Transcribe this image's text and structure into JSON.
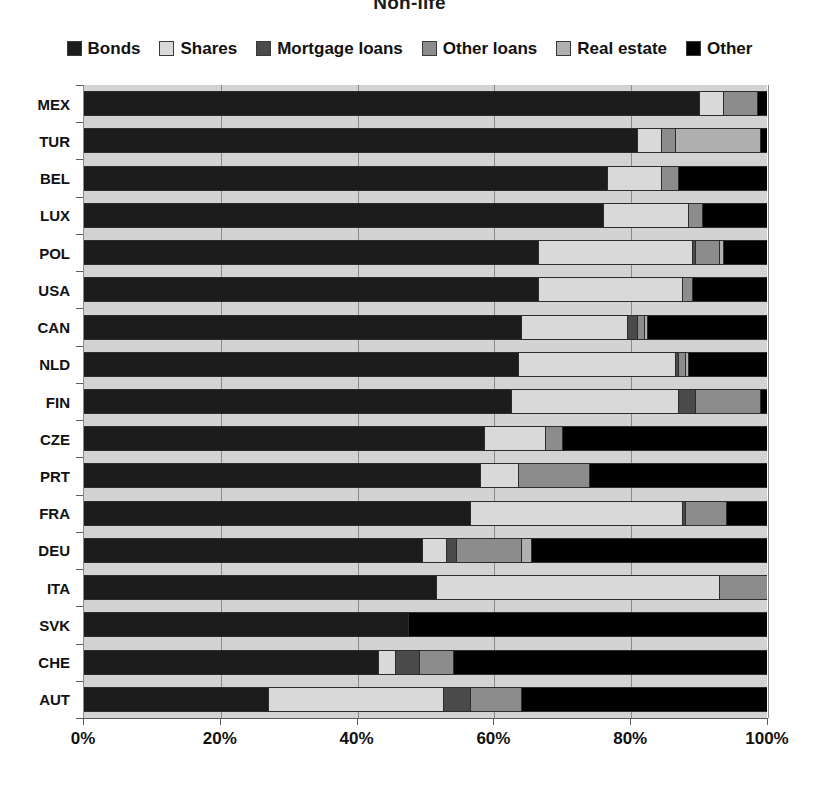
{
  "chart_data": {
    "type": "bar",
    "orientation": "horizontal",
    "stacked": true,
    "normalized": true,
    "title": "Non-life",
    "xlabel": "",
    "ylabel": "",
    "xlim": [
      0,
      100
    ],
    "xticks": [
      "0%",
      "20%",
      "40%",
      "60%",
      "80%",
      "100%"
    ],
    "xtick_values": [
      0,
      20,
      40,
      60,
      80,
      100
    ],
    "grid": true,
    "legend_position": "top",
    "categories": [
      "MEX",
      "TUR",
      "BEL",
      "LUX",
      "POL",
      "USA",
      "CAN",
      "NLD",
      "FIN",
      "CZE",
      "PRT",
      "FRA",
      "DEU",
      "ITA",
      "SVK",
      "CHE",
      "AUT"
    ],
    "series": [
      {
        "name": "Bonds",
        "color": "#1c1c1c",
        "values": [
          90.0,
          81.0,
          76.5,
          76.0,
          66.5,
          66.5,
          64.0,
          63.5,
          62.5,
          58.5,
          58.0,
          56.5,
          49.5,
          51.5,
          47.5,
          43.0,
          27.0
        ]
      },
      {
        "name": "Shares",
        "color": "#d9d9d9",
        "values": [
          3.5,
          3.5,
          8.0,
          12.5,
          22.5,
          21.0,
          15.5,
          23.0,
          24.5,
          9.0,
          5.5,
          31.0,
          3.5,
          41.5,
          0.0,
          2.5,
          25.5
        ]
      },
      {
        "name": "Mortgage loans",
        "color": "#4a4a4a",
        "values": [
          0.0,
          0.0,
          0.0,
          0.0,
          0.5,
          0.0,
          1.5,
          0.5,
          2.5,
          0.0,
          0.0,
          0.5,
          1.5,
          0.0,
          0.0,
          3.5,
          4.0
        ]
      },
      {
        "name": "Other loans",
        "color": "#8c8c8c",
        "values": [
          5.0,
          2.0,
          2.5,
          2.0,
          3.5,
          1.5,
          1.0,
          1.0,
          9.5,
          2.5,
          10.5,
          6.0,
          9.5,
          7.0,
          0.0,
          5.0,
          7.5
        ]
      },
      {
        "name": "Real estate",
        "color": "#b0b0b0",
        "values": [
          0.0,
          12.5,
          0.0,
          0.0,
          0.5,
          0.0,
          0.5,
          0.5,
          0.0,
          0.0,
          0.0,
          0.0,
          1.5,
          0.0,
          0.0,
          0.0,
          0.0
        ]
      },
      {
        "name": "Other",
        "color": "#000000",
        "values": [
          1.5,
          1.0,
          13.0,
          9.5,
          6.5,
          11.0,
          17.5,
          11.5,
          1.0,
          30.0,
          26.0,
          6.0,
          34.5,
          0.0,
          52.5,
          46.0,
          36.0
        ]
      }
    ]
  },
  "legend": {
    "items": [
      {
        "label": "Bonds",
        "color": "#1c1c1c"
      },
      {
        "label": "Shares",
        "color": "#d9d9d9"
      },
      {
        "label": "Mortgage loans",
        "color": "#4a4a4a"
      },
      {
        "label": "Other loans",
        "color": "#8c8c8c"
      },
      {
        "label": "Real estate",
        "color": "#b0b0b0"
      },
      {
        "label": "Other",
        "color": "#000000"
      }
    ]
  }
}
